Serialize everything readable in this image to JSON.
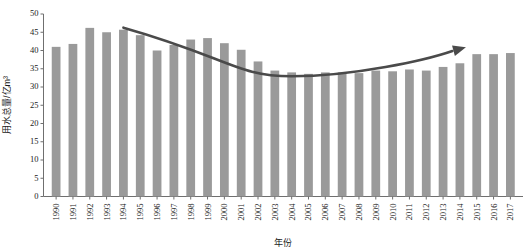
{
  "chart_data": {
    "type": "bar",
    "title": "",
    "xlabel": "年份",
    "ylabel": "用水总量/亿m³",
    "ylim": [
      0,
      50
    ],
    "ytick_step": 5,
    "grid": false,
    "legend": "none",
    "bar_color": "#9a9a9a",
    "trend_color": "#4a4a4a",
    "axis_color": "#6f6f6f",
    "categories": [
      "1990",
      "1991",
      "1992",
      "1993",
      "1994",
      "1995",
      "1996",
      "1997",
      "1998",
      "1999",
      "2000",
      "2001",
      "2002",
      "2003",
      "2004",
      "2005",
      "2006",
      "2007",
      "2008",
      "2009",
      "2010",
      "2011",
      "2012",
      "2013",
      "2014",
      "2015",
      "2016",
      "2017"
    ],
    "values": [
      41.0,
      41.8,
      46.2,
      45.0,
      45.7,
      44.2,
      40.0,
      41.5,
      43.0,
      43.4,
      42.0,
      40.2,
      37.0,
      34.5,
      34.0,
      33.6,
      34.0,
      34.0,
      33.8,
      34.5,
      34.3,
      34.8,
      34.5,
      35.5,
      36.5,
      39.0,
      39.0,
      39.3
    ],
    "yticks": [
      "0",
      "5",
      "10",
      "15",
      "20",
      "25",
      "30",
      "35",
      "40",
      "45",
      "50"
    ],
    "annotations": [
      {
        "name": "trend-arrow",
        "description": "U-shaped declining-then-rising trend arrow",
        "start_category": "1994",
        "end_category": "2014",
        "start_value": 45.7,
        "min_value": 33.2,
        "end_value": 39.5
      }
    ]
  }
}
